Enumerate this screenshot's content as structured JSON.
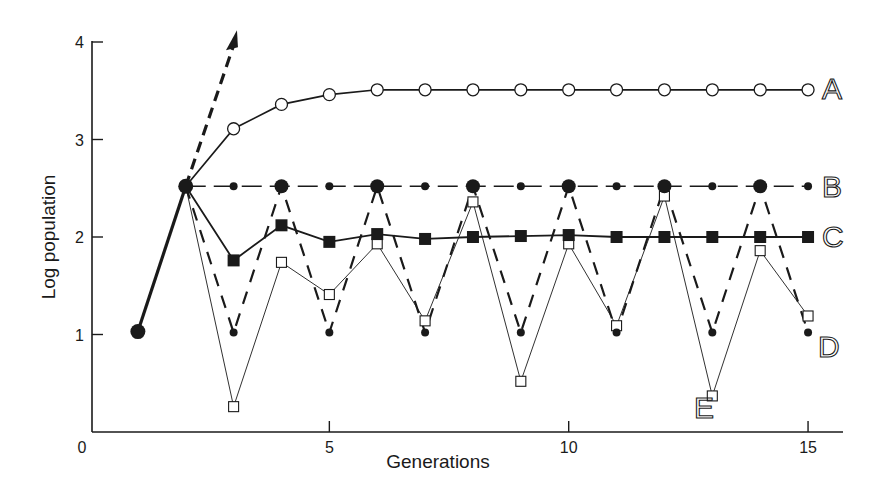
{
  "chart_data": {
    "type": "line",
    "title": "",
    "xlabel": "Generations",
    "ylabel": "Log population",
    "xlim": [
      0,
      15.8
    ],
    "ylim": [
      0,
      4
    ],
    "x_ticks": [
      0,
      5,
      10,
      15
    ],
    "x_tick_labels": [
      "0",
      "5",
      "10",
      "15"
    ],
    "y_ticks": [
      1,
      2,
      3,
      4
    ],
    "y_tick_labels": [
      "1",
      "2",
      "3",
      "4"
    ],
    "grid": false,
    "legend": "inline labels at right end of each series",
    "initial": {
      "name": "start",
      "x": [
        1,
        2
      ],
      "y": [
        1.03,
        2.52
      ],
      "marker": "large filled circle",
      "line": "thick solid"
    },
    "arrow": {
      "description": "dashed arrow indicating unbounded growth",
      "from": [
        2,
        2.52
      ],
      "to": [
        3.07,
        4.12
      ]
    },
    "series": [
      {
        "name": "A",
        "marker": "open circle",
        "line": "solid",
        "x": [
          2,
          3,
          4,
          5,
          6,
          7,
          8,
          9,
          10,
          11,
          12,
          13,
          14,
          15
        ],
        "values": [
          2.52,
          3.11,
          3.36,
          3.46,
          3.51,
          3.51,
          3.51,
          3.51,
          3.51,
          3.51,
          3.51,
          3.51,
          3.51,
          3.51
        ]
      },
      {
        "name": "B",
        "marker": "filled circle (large at even generations, small at odd)",
        "line": "dash-dot",
        "x": [
          2,
          3,
          4,
          5,
          6,
          7,
          8,
          9,
          10,
          11,
          12,
          13,
          14,
          15
        ],
        "values": [
          2.52,
          2.52,
          2.52,
          2.52,
          2.52,
          2.52,
          2.52,
          2.52,
          2.52,
          2.52,
          2.52,
          2.52,
          2.52,
          2.52
        ]
      },
      {
        "name": "C",
        "marker": "filled square",
        "line": "solid",
        "x": [
          2,
          3,
          4,
          5,
          6,
          7,
          8,
          9,
          10,
          11,
          12,
          13,
          14,
          15
        ],
        "values": [
          2.52,
          1.76,
          2.12,
          1.95,
          2.03,
          1.98,
          2.0,
          2.01,
          2.02,
          2.0,
          2.0,
          2.0,
          2.0,
          2.0
        ]
      },
      {
        "name": "D",
        "marker": "filled circle",
        "line": "dashed",
        "x": [
          2,
          3,
          4,
          5,
          6,
          7,
          8,
          9,
          10,
          11,
          12,
          13,
          14,
          15
        ],
        "values": [
          2.52,
          1.02,
          2.52,
          1.02,
          2.52,
          1.02,
          2.52,
          1.02,
          2.52,
          1.02,
          2.52,
          1.02,
          2.52,
          1.02
        ]
      },
      {
        "name": "E",
        "marker": "open square",
        "line": "thin solid",
        "x": [
          2,
          3,
          4,
          5,
          6,
          7,
          8,
          9,
          10,
          11,
          12,
          13,
          14,
          15
        ],
        "values": [
          2.52,
          0.26,
          1.74,
          1.41,
          1.93,
          1.14,
          2.36,
          0.52,
          1.93,
          1.09,
          2.42,
          0.37,
          1.86,
          1.19
        ]
      }
    ]
  },
  "axes": {
    "x_title": "Generations",
    "y_title": "Log population",
    "x_tick_labels": [
      "0",
      "5",
      "10",
      "15"
    ],
    "y_tick_labels": [
      "1",
      "2",
      "3",
      "4"
    ]
  },
  "labels": {
    "A": "A",
    "B": "B",
    "C": "C",
    "D": "D",
    "E": "E"
  }
}
